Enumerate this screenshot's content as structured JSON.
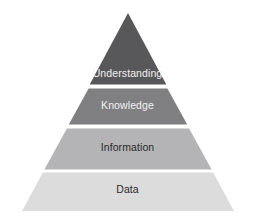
{
  "diagram": {
    "name": "DIKW Pyramid",
    "apex": {
      "x": 128,
      "y": 13
    },
    "base_left": {
      "x": 22,
      "y": 211
    },
    "base_right": {
      "x": 234,
      "y": 211
    },
    "background_color": "#ffffff",
    "separator_color": "#ffffff",
    "tiers": [
      {
        "id": "understanding",
        "label": "Understanding",
        "fill": "#58585a",
        "text_color": "#f2f2f2",
        "top_y": 13,
        "bottom_y": 86,
        "points": "128,13 166.3,84.6 89.7,84.6"
      },
      {
        "id": "knowledge",
        "label": "Knowledge",
        "fill": "#808082",
        "text_color": "#f2f2f2",
        "top_y": 88,
        "bottom_y": 124,
        "points": "88.6,88.5 167.4,88.5 187.2,124.5 68.8,124.5"
      },
      {
        "id": "information",
        "label": "Information",
        "fill": "#b4b4b6",
        "text_color": "#2b2b2b",
        "top_y": 128,
        "bottom_y": 169,
        "points": "66.9,128.5 189.1,128.5 211.6,169.5 44.4,169.5"
      },
      {
        "id": "data",
        "label": "Data",
        "fill": "#dcdcdc",
        "text_color": "#2b2b2b",
        "top_y": 172,
        "bottom_y": 211,
        "points": "42.8,172.5 213.2,172.5 234,211 22,211"
      }
    ]
  }
}
